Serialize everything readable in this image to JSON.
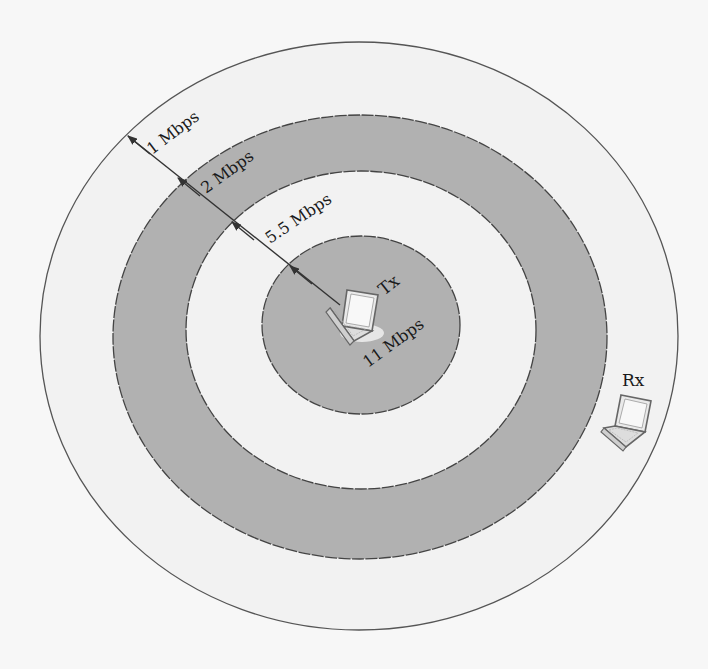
{
  "diagram": {
    "type": "concentric-coverage-rings",
    "colors": {
      "background": "#f7f7f7",
      "light_band": "#f2f2f2",
      "dark_band": "#b1b1b1",
      "outline": "#444444",
      "text": "#1a1a1a"
    },
    "rings": [
      {
        "rate": "1 Mbps",
        "fill": "light"
      },
      {
        "rate": "2 Mbps",
        "fill": "dark"
      },
      {
        "rate": "5.5 Mbps",
        "fill": "light"
      },
      {
        "rate": "11 Mbps",
        "fill": "dark"
      }
    ],
    "labels": {
      "ring_1": "1 Mbps",
      "ring_2": "2 Mbps",
      "ring_3": "5.5 Mbps",
      "ring_4": "11 Mbps"
    },
    "nodes": {
      "transmitter": {
        "label": "Tx"
      },
      "receiver": {
        "label": "Rx"
      }
    }
  }
}
